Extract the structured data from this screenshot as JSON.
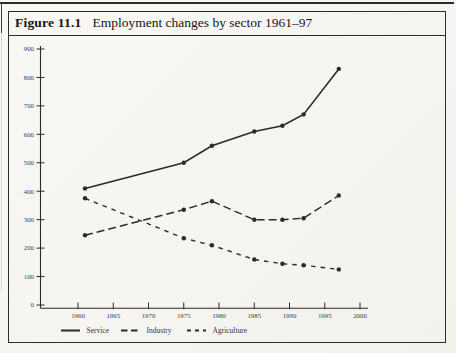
{
  "page": {
    "figure_label": "Figure 11.1",
    "figure_title": "Employment changes by sector 1961–97"
  },
  "chart_data": {
    "type": "line",
    "title": "Employment changes by sector 1961–97",
    "x": [
      1961,
      1975,
      1979,
      1985,
      1989,
      1992,
      1997
    ],
    "series": [
      {
        "name": "Service",
        "line_style": "solid",
        "values": [
          410,
          500,
          560,
          610,
          630,
          670,
          830
        ]
      },
      {
        "name": "Industry",
        "line_style": "long-dash",
        "values": [
          245,
          335,
          365,
          300,
          300,
          305,
          385
        ]
      },
      {
        "name": "Agriculture",
        "line_style": "short-dash",
        "values": [
          375,
          235,
          210,
          160,
          145,
          140,
          125
        ]
      }
    ],
    "xlabel": "",
    "ylabel": "",
    "xlim": [
      1960,
      2000
    ],
    "ylim": [
      0,
      900
    ],
    "x_ticks": [
      1960,
      1965,
      1970,
      1975,
      1980,
      1985,
      1990,
      1995,
      2000
    ],
    "y_ticks": [
      0,
      100,
      200,
      300,
      400,
      500,
      600,
      700,
      800,
      900
    ],
    "grid": false,
    "legend_position": "bottom",
    "marker": "circle",
    "ink_color": "#2b2b2b"
  }
}
